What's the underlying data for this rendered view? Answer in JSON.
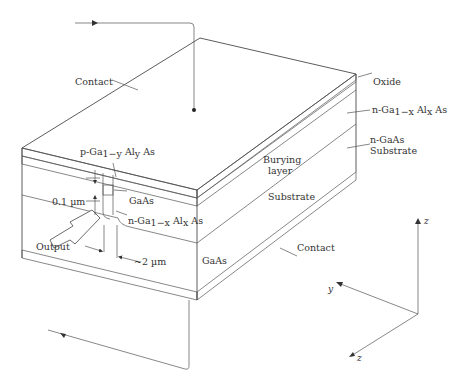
{
  "figure": {
    "type": "buried-heterostructure laser diagram",
    "colors": {
      "line": "#4a4a4a",
      "text": "#333333",
      "background": "#ffffff"
    }
  },
  "labels": {
    "contact_top": "Contact",
    "oxide": "Oxide",
    "n_gaalas_prefix": "n-Ga",
    "n_gaalas_sub1": "1−x",
    "n_gaalas_mid": " Al",
    "n_gaalas_sub2": "x",
    "n_gaalas_suffix": " As",
    "n_gaas_line1": "n-GaAs",
    "n_gaas_line2": "Substrate",
    "burying_line1": "Burying",
    "burying_line2": "layer",
    "substrate": "Substrate",
    "p_gaalas_prefix": "p-Ga",
    "p_gaalas_sub1": "1−y",
    "p_gaalas_mid": " Al",
    "p_gaalas_sub2": "y",
    "p_gaalas_suffix": " As",
    "thickness": "0.1 µm",
    "gaas_active": "GaAs",
    "n_gaalas2_prefix": "n-Ga",
    "n_gaalas2_sub1": "1−x",
    "n_gaalas2_mid": " Al",
    "n_gaalas2_sub2": "x",
    "n_gaalas2_suffix": " As",
    "output": "Output",
    "width": "~2 µm",
    "gaas_front": "GaAs",
    "contact_bottom": "Contact"
  },
  "axes": {
    "up": "z",
    "left": "y",
    "down": "z"
  }
}
